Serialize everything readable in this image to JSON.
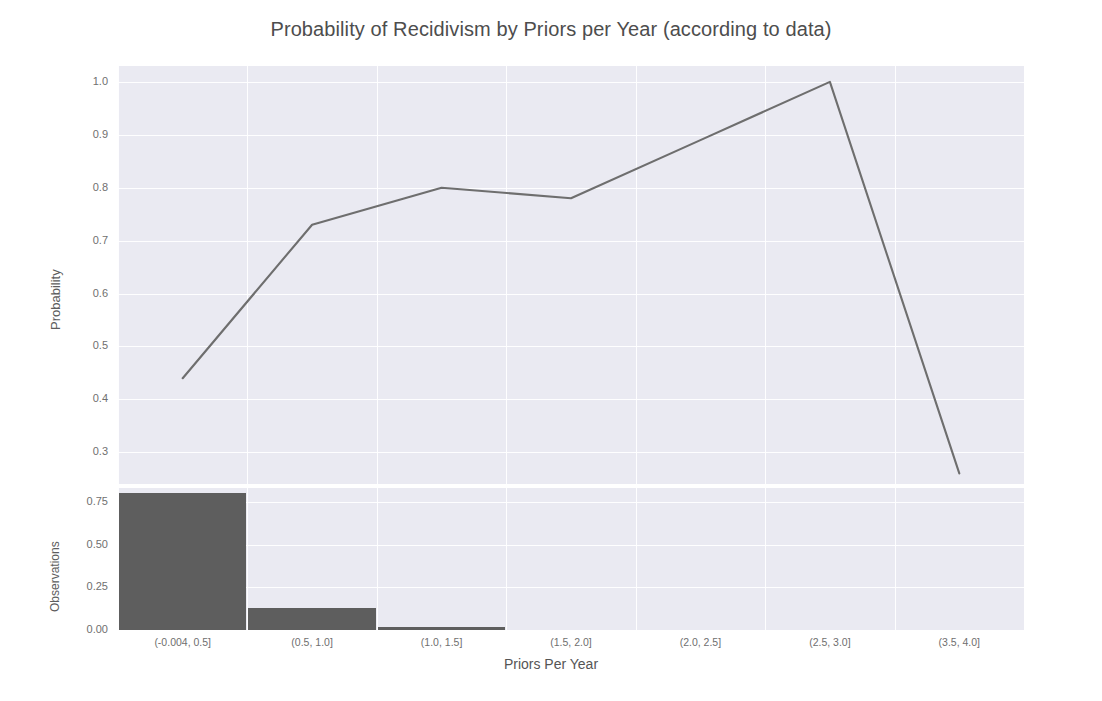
{
  "chart_data": {
    "type": "line",
    "title": "Probability of Recidivism by Priors per Year (according to data)",
    "xlabel": "Priors Per Year",
    "ylabel": "Probability",
    "categories": [
      "(-0.004, 0.5]",
      "(0.5, 1.0]",
      "(1.0, 1.5]",
      "(1.5, 2.0]",
      "(2.0, 2.5]",
      "(2.5, 3.0]",
      "(3.5, 4.0]"
    ],
    "values": [
      0.44,
      0.73,
      0.8,
      0.78,
      0.89,
      1.0,
      0.26
    ],
    "ylim": [
      0.24,
      1.03
    ],
    "yticks": [
      "1.0",
      "0.9",
      "0.8",
      "0.7",
      "0.6",
      "0.5",
      "0.4",
      "0.3"
    ],
    "ytick_values": [
      1.0,
      0.9,
      0.8,
      0.7,
      0.6,
      0.5,
      0.4,
      0.3
    ],
    "grid": true,
    "legend": "none",
    "line_color": "#6e6e6e",
    "panel_background": "#eaeaf2",
    "subplot": {
      "type": "bar",
      "ylabel": "Observations",
      "categories": [
        "(-0.004, 0.5]",
        "(0.5, 1.0]",
        "(1.0, 1.5]",
        "(1.5, 2.0]",
        "(2.0, 2.5]",
        "(2.5, 3.0]",
        "(3.5, 4.0]"
      ],
      "values": [
        0.8,
        0.13,
        0.015,
        0.0,
        0.0,
        0.0,
        0.0
      ],
      "yticks": [
        "0.75",
        "0.50",
        "0.25",
        "0.00"
      ],
      "ytick_values": [
        0.75,
        0.5,
        0.25,
        0.0
      ],
      "ylim": [
        0.0,
        0.83
      ],
      "bar_color": "#5e5e5e"
    }
  },
  "axis": {
    "top_yticks": [
      {
        "label": "1.0"
      },
      {
        "label": "0.9"
      },
      {
        "label": "0.8"
      },
      {
        "label": "0.7"
      },
      {
        "label": "0.6"
      },
      {
        "label": "0.5"
      },
      {
        "label": "0.4"
      },
      {
        "label": "0.3"
      }
    ],
    "bottom_yticks": [
      {
        "label": "0.75"
      },
      {
        "label": "0.50"
      },
      {
        "label": "0.25"
      },
      {
        "label": "0.00"
      }
    ],
    "xticks": [
      {
        "label": "(-0.004, 0.5]"
      },
      {
        "label": "(0.5, 1.0]"
      },
      {
        "label": "(1.0, 1.5]"
      },
      {
        "label": "(1.5, 2.0]"
      },
      {
        "label": "(2.0, 2.5]"
      },
      {
        "label": "(2.5, 3.0]"
      },
      {
        "label": "(3.5, 4.0]"
      }
    ]
  }
}
